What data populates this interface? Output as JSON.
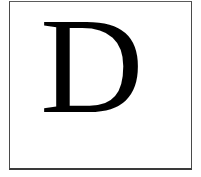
{
  "page": {
    "background_color": "#ffffff",
    "width": 201,
    "height": 177
  },
  "frame": {
    "name": "rule-box",
    "border_color": "#4a4a4a",
    "bottom_border_color": "#3a3a3a"
  },
  "content": {
    "dropcap_letter": "D",
    "letter_color": "#000000",
    "typeface_style": "serif"
  }
}
